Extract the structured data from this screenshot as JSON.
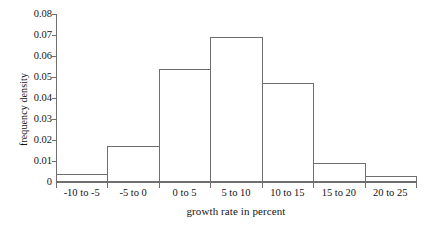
{
  "chart_data": {
    "type": "bar",
    "title": "",
    "xlabel": "growth rate in percent",
    "ylabel": "frequency density",
    "categories": [
      "-10 to -5",
      "-5 to 0",
      "0 to 5",
      "5 to 10",
      "10 to 15",
      "15 to 20",
      "20 to 25"
    ],
    "values": [
      0.004,
      0.017,
      0.054,
      0.069,
      0.047,
      0.009,
      0.003
    ],
    "ylim": [
      0,
      0.08
    ],
    "ytick_labels": [
      "0",
      "0.01",
      "0.02",
      "0.03",
      "0.04",
      "0.05",
      "0.06",
      "0.07",
      "0.08"
    ],
    "ytick_values": [
      0,
      0.01,
      0.02,
      0.03,
      0.04,
      0.05,
      0.06,
      0.07,
      0.08
    ],
    "grid": false,
    "legend": false,
    "bar_fill_color": "#ffffff",
    "bar_border_color": "#6e6e6e",
    "axis_color": "#6e6e6e",
    "background_color": "#ffffff",
    "text_color": "#141414"
  }
}
